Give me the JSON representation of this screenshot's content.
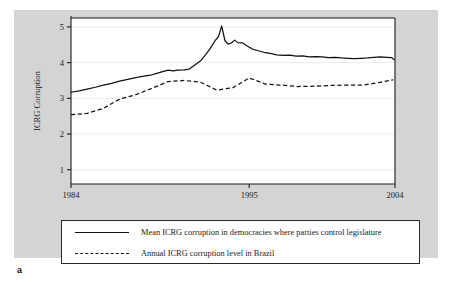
{
  "panel": {
    "letter": "a"
  },
  "legend": {
    "entries": [
      {
        "style": "solid",
        "label": "Mean ICRG corruption in democracies where parties control legislature"
      },
      {
        "style": "dashed",
        "label": "Annual ICRG corruption level in Brazil"
      }
    ]
  },
  "chart_data": {
    "type": "line",
    "title": "",
    "xlabel": "",
    "ylabel": "ICRG Corruption",
    "xlim": [
      1984,
      2004
    ],
    "ylim": [
      0.6,
      5.25
    ],
    "xticks": [
      1984,
      1995,
      2004
    ],
    "xticklabels": [
      "1984",
      "1995",
      "2004"
    ],
    "yticks": [
      1,
      2,
      3,
      4,
      5
    ],
    "yticklabels": [
      "1",
      "2",
      "3",
      "4",
      "5"
    ],
    "grid": "horizontal",
    "colors": {
      "line": "#111111",
      "panel": "#d4d4d4",
      "plot": "#ffffff",
      "grid": "#e6e6e6"
    },
    "series": [
      {
        "name": "Mean ICRG corruption in democracies where parties control legislature",
        "style": "solid",
        "x": [
          1984.0,
          1984.5,
          1985.0,
          1985.5,
          1986.0,
          1986.5,
          1987.0,
          1987.5,
          1988.0,
          1988.5,
          1989.0,
          1989.3,
          1989.6,
          1990.0,
          1990.3,
          1990.6,
          1991.0,
          1991.3,
          1991.6,
          1992.0,
          1992.3,
          1992.6,
          1992.9,
          1993.1,
          1993.3,
          1993.5,
          1993.7,
          1993.9,
          1994.1,
          1994.3,
          1994.6,
          1994.9,
          1995.2,
          1995.5,
          1995.9,
          1996.3,
          1996.7,
          1997.1,
          1997.5,
          1997.9,
          1998.3,
          1998.7,
          1999.1,
          1999.5,
          1999.9,
          2000.3,
          2000.7,
          2001.1,
          2001.5,
          2001.9,
          2002.3,
          2002.7,
          2003.1,
          2003.5,
          2003.8,
          2003.95
        ],
        "y": [
          3.17,
          3.21,
          3.26,
          3.31,
          3.37,
          3.42,
          3.48,
          3.53,
          3.58,
          3.62,
          3.66,
          3.7,
          3.74,
          3.79,
          3.77,
          3.79,
          3.8,
          3.82,
          3.92,
          4.05,
          4.22,
          4.4,
          4.62,
          4.72,
          5.03,
          4.62,
          4.52,
          4.55,
          4.63,
          4.56,
          4.55,
          4.46,
          4.38,
          4.34,
          4.29,
          4.26,
          4.22,
          4.2,
          4.21,
          4.18,
          4.19,
          4.16,
          4.17,
          4.16,
          4.14,
          4.15,
          4.13,
          4.12,
          4.11,
          4.12,
          4.13,
          4.15,
          4.16,
          4.15,
          4.14,
          4.08
        ]
      },
      {
        "name": "Annual ICRG corruption level in Brazil",
        "style": "dashed",
        "x": [
          1984.0,
          1985.0,
          1986.0,
          1987.0,
          1988.0,
          1989.0,
          1990.0,
          1991.0,
          1992.0,
          1993.0,
          1994.0,
          1995.0,
          1996.0,
          1997.0,
          1998.0,
          1999.0,
          2000.0,
          2001.0,
          2002.0,
          2003.0,
          2003.9
        ],
        "y": [
          2.54,
          2.58,
          2.72,
          2.98,
          3.1,
          3.28,
          3.47,
          3.5,
          3.45,
          3.23,
          3.3,
          3.57,
          3.4,
          3.37,
          3.33,
          3.34,
          3.36,
          3.37,
          3.37,
          3.44,
          3.52
        ]
      }
    ]
  }
}
